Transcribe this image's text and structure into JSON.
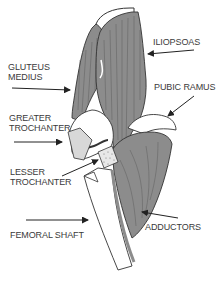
{
  "diagram": {
    "colors": {
      "muscle": "#8c8c8c",
      "muscle_dark": "#5e5e5e",
      "outline": "#333333",
      "bone": "#ffffff",
      "bone_shade": "#d8d8d8",
      "text": "#3a3a3a",
      "background": "#ffffff"
    },
    "labels": {
      "gluteus_medius": {
        "line1": "GLUTEUS",
        "line2": "MEDIUS"
      },
      "greater_trochanter": {
        "line1": "GREATER",
        "line2": "TROCHANTER"
      },
      "lesser_trochanter": {
        "line1": "LESSER",
        "line2": "TROCHANTER"
      },
      "femoral_shaft": {
        "line1": "FEMORAL SHAFT"
      },
      "iliopsoas": {
        "line1": "ILIOPSOAS"
      },
      "pubic_ramus": {
        "line1": "PUBIC RAMUS"
      },
      "adductors": {
        "line1": "ADDUCTORS"
      }
    }
  }
}
